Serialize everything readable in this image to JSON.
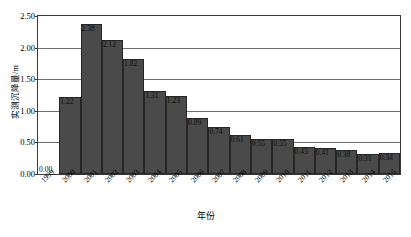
{
  "caption": {
    "top": "",
    "bottom": ""
  },
  "chart_data": {
    "type": "bar",
    "title": "",
    "xlabel": "年份",
    "ylabel": "实测沉降量/m",
    "categories": [
      "1999",
      "2000",
      "2001",
      "2002",
      "2003",
      "2004",
      "2005",
      "2006",
      "2007",
      "2008",
      "2009",
      "2010",
      "2011",
      "2012",
      "2013",
      "2014",
      "2015"
    ],
    "values": [
      0.0,
      1.22,
      2.38,
      2.12,
      1.82,
      1.31,
      1.23,
      0.89,
      0.74,
      0.61,
      0.55,
      0.55,
      0.43,
      0.41,
      0.38,
      0.31,
      0.34
    ],
    "value_labels": [
      "0.00",
      "1.22",
      "2.38",
      "2.12",
      "1.82",
      "1.31",
      "1.23",
      "0.89",
      "0.74",
      "0.61",
      "0.55",
      "0.55",
      "0.43",
      "0.41",
      "0.38",
      "0.31",
      "0.34"
    ],
    "ylim": [
      0,
      2.5
    ],
    "yticks": [
      0.0,
      0.5,
      1.0,
      1.5,
      2.0,
      2.5
    ],
    "ytick_labels": [
      "0.00",
      "0.50",
      "1.00",
      "1.50",
      "2.00",
      "2.50"
    ],
    "grid": true,
    "legend": null,
    "series_color": "#4a4a4a",
    "axis_color": "#3a3a3a",
    "grid_color": "#6e6e6e"
  }
}
